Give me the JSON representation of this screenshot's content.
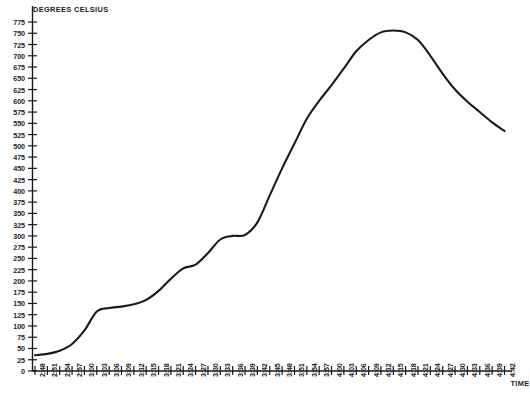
{
  "chart_data": {
    "type": "line",
    "title": "",
    "xlabel": "TIME",
    "ylabel": "DEGREES CELSIUS",
    "ylim": [
      0,
      775
    ],
    "ytick_step": 25,
    "grid": false,
    "legend": null,
    "yticks": [
      0,
      25,
      50,
      75,
      100,
      125,
      150,
      175,
      200,
      225,
      250,
      275,
      300,
      325,
      350,
      375,
      400,
      425,
      450,
      475,
      500,
      525,
      550,
      575,
      600,
      625,
      650,
      675,
      700,
      725,
      750,
      775
    ],
    "xticks": [
      "2:48",
      "2:51",
      "2:54",
      "2:57",
      "3:00",
      "3:03",
      "3:06",
      "3:09",
      "3:12",
      "3:15",
      "3:18",
      "3:21",
      "3:24",
      "3:27",
      "3:30",
      "3:33",
      "3:36",
      "3:39",
      "3:42",
      "3:45",
      "3:48",
      "3:51",
      "3:54",
      "3:57",
      "4:00",
      "4:03",
      "4:06",
      "4:09",
      "4:12",
      "4:15",
      "4:18",
      "4:21",
      "4:24",
      "4:27",
      "4:30",
      "4:33",
      "4:36",
      "4:39",
      "4:42"
    ],
    "series": [
      {
        "name": "temperature",
        "color": "#1a1a1a",
        "x": [
          "2:48",
          "2:51",
          "2:54",
          "2:57",
          "3:00",
          "3:03",
          "3:06",
          "3:09",
          "3:12",
          "3:15",
          "3:18",
          "3:21",
          "3:24",
          "3:27",
          "3:30",
          "3:33",
          "3:36",
          "3:39",
          "3:42",
          "3:45",
          "3:48",
          "3:51",
          "3:54",
          "3:57",
          "4:00",
          "4:03",
          "4:06",
          "4:09",
          "4:12",
          "4:15",
          "4:18",
          "4:21",
          "4:24",
          "4:27",
          "4:30",
          "4:33",
          "4:36",
          "4:39",
          "4:42"
        ],
        "values": [
          35,
          38,
          45,
          60,
          90,
          132,
          140,
          143,
          148,
          158,
          178,
          205,
          228,
          236,
          262,
          292,
          300,
          302,
          330,
          390,
          450,
          505,
          560,
          600,
          635,
          672,
          710,
          735,
          752,
          756,
          752,
          735,
          700,
          660,
          625,
          598,
          575,
          552,
          533
        ]
      }
    ]
  },
  "axis": {
    "y_title": "DEGREES CELSIUS",
    "x_title": "TIME"
  },
  "caption": ""
}
